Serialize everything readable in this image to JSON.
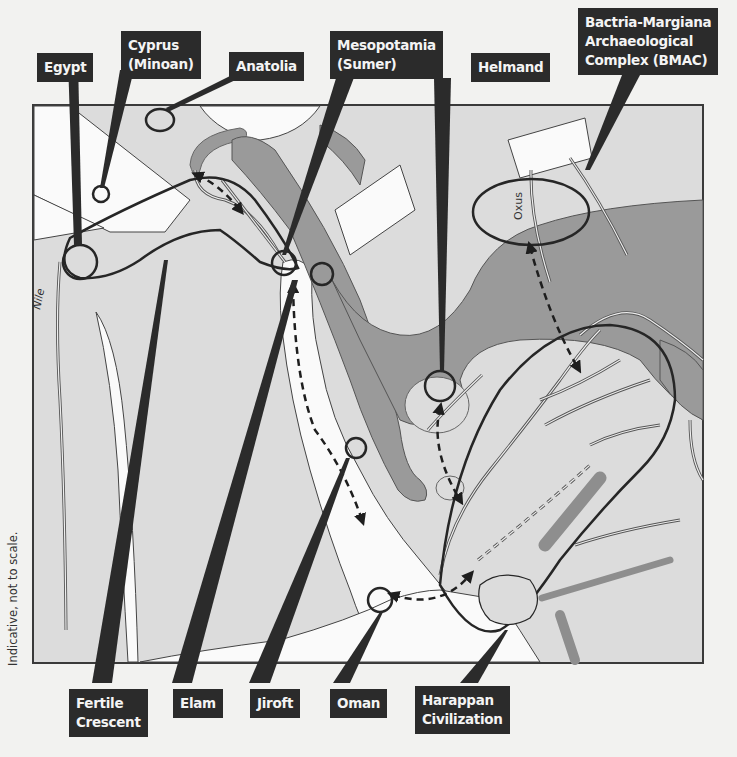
{
  "diagram": {
    "type": "schematic map",
    "note": "Indicative, not to scale.",
    "colors": {
      "background": "#f2f2f0",
      "land": "#dcdcdc",
      "highland": "#9a9a9a",
      "lowland_white": "#fafafa",
      "callout_box": "#2b2b2b",
      "callout_text": "#f4f4f4",
      "outline": "#2a2a2a"
    },
    "map_labels": {
      "nile": "Nile",
      "oxus": "Oxus"
    },
    "callouts": {
      "egypt": "Egypt",
      "cyprus": "Cyprus\n(Minoan)",
      "anatolia": "Anatolia",
      "mesopotamia": "Mesopotamia\n(Sumer)",
      "helmand": "Helmand",
      "bmac": "Bactria-Margiana\nArchaeological\nComplex (BMAC)",
      "fertile_crescent": "Fertile\nCrescent",
      "elam": "Elam",
      "jiroft": "Jiroft",
      "oman": "Oman",
      "harappan": "Harappan\nCivilization"
    },
    "top_callouts": [
      "Egypt",
      "Cyprus (Minoan)",
      "Anatolia",
      "Mesopotamia (Sumer)",
      "Helmand",
      "Bactria-Margiana Archaeological Complex (BMAC)"
    ],
    "bottom_callouts": [
      "Fertile Crescent",
      "Elam",
      "Jiroft",
      "Oman",
      "Harappan Civilization"
    ],
    "connections": [
      {
        "from": "Anatolia coast",
        "to": "Mesopotamia upper",
        "style": "dashed double-arrow"
      },
      {
        "from": "Mesopotamia (Sumer)",
        "to": "Persian Gulf (Jiroft/Oman)",
        "style": "dashed double-arrow"
      },
      {
        "from": "Helmand",
        "to": "Indus delta",
        "style": "dashed double-arrow"
      },
      {
        "from": "Oman",
        "to": "Harappan coast",
        "style": "dashed double-arrow"
      },
      {
        "from": "BMAC (Oxus)",
        "to": "Harappan north",
        "style": "dashed double-arrow"
      }
    ]
  }
}
